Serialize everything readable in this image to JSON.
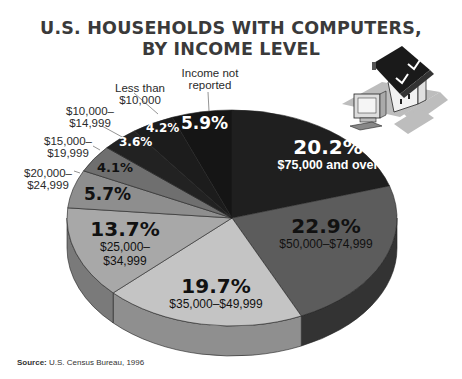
{
  "title": {
    "line1": "U.S. HOUSEHOLDS WITH COMPUTERS,",
    "line2": "BY INCOME LEVEL"
  },
  "source": {
    "label": "Source:",
    "text": "U.S. Census Bureau, 1996"
  },
  "illustration": "house-with-computer-icon",
  "chart_data": {
    "type": "pie",
    "style": "3d-pie",
    "categories": [
      "$75,000 and over",
      "$50,000–$74,999",
      "$35,000–$49,999",
      "$25,000–$34,999",
      "$20,000–$24,999",
      "$15,000–$19,999",
      "$10,000–$14,999",
      "Less than $10,000",
      "Income not reported"
    ],
    "values": [
      20.2,
      22.9,
      19.7,
      13.7,
      5.7,
      4.1,
      3.6,
      4.2,
      5.9
    ],
    "unit": "%",
    "colors": [
      "#1f1f1f",
      "#5c5c5c",
      "#c4c4c4",
      "#a8a8a8",
      "#8e8e8e",
      "#6f6f6f",
      "#222222",
      "#1c1c1c",
      "#151515"
    ],
    "side_colors": [
      "#141414",
      "#333333",
      "#8f8f8f",
      "#7a7a7a",
      "#666666",
      "#505050",
      "#161616",
      "#111111",
      "#0e0e0e"
    ],
    "source": "U.S. Census Bureau, 1996"
  },
  "labels": {
    "s0": {
      "pct": "20.2%",
      "name": "$75,000 and over"
    },
    "s1": {
      "pct": "22.9%",
      "name": "$50,000–$74,999"
    },
    "s2": {
      "pct": "19.7%",
      "name": "$35,000–$49,999"
    },
    "s3": {
      "pct": "13.7%",
      "name1": "$25,000–",
      "name2": "$34,999"
    },
    "s4": {
      "pct": "5.7%",
      "name1": "$20,000–",
      "name2": "$24,999"
    },
    "s5": {
      "pct": "4.1%",
      "name1": "$15,000–",
      "name2": "$19,999"
    },
    "s6": {
      "pct": "3.6%",
      "name1": "$10,000–",
      "name2": "$14,999"
    },
    "s7": {
      "pct": "4.2%",
      "name1": "Less than",
      "name2": "$10,000"
    },
    "s8": {
      "pct": "5.9%",
      "name1": "Income not",
      "name2": "reported"
    }
  }
}
